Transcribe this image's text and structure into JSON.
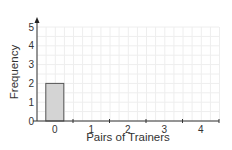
{
  "chart_data": {
    "type": "bar",
    "title": "",
    "xlabel": "Pairs of Trainers",
    "ylabel": "Frequency",
    "categories": [
      "0",
      "1",
      "2",
      "3",
      "4"
    ],
    "values": [
      2,
      null,
      null,
      null,
      null
    ],
    "ylim": [
      0,
      5
    ],
    "yticks": [
      0,
      1,
      2,
      3,
      4,
      5
    ],
    "grid": true,
    "legend": null,
    "colors": {
      "bar_fill": "#d4d4d4",
      "bar_stroke": "#555555",
      "axis": "#333333",
      "grid": "#eeeeee"
    }
  }
}
